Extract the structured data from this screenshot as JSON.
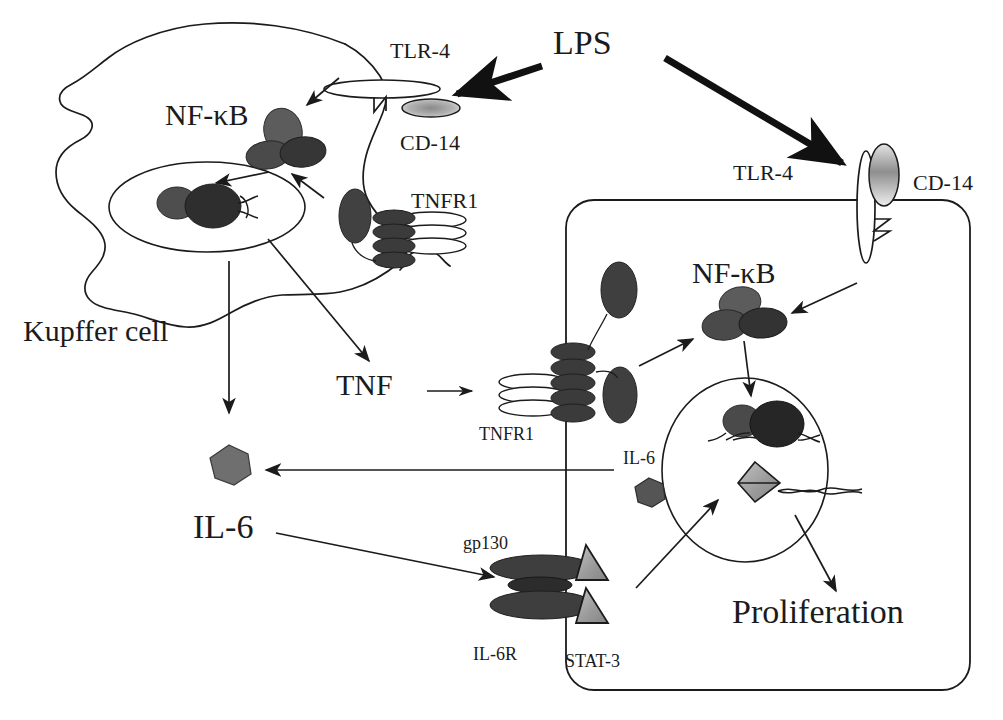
{
  "figure": {
    "kind": "biological-signaling-pathway-diagram",
    "background_color": "#ffffff",
    "ink_color": "#1b1b1b"
  },
  "palette": {
    "outline": "#1b1b1b",
    "protein_dark": "#3a3a3a",
    "protein_mid": "#565656",
    "protein_light_grey": "#8f8f8f",
    "protein_fill_white": "#ffffff",
    "stat3_grey": "#9b9b9b",
    "cd14_grey": "#9a9a9a"
  },
  "labels": {
    "lps": "LPS",
    "kupffer_cell": "Kupffer cell",
    "nfkb_kupffer": "NF-κB",
    "nfkb_hepatocyte": "NF-κB",
    "tlr4_kupffer": "TLR-4",
    "tlr4_hepatocyte": "TLR-4",
    "cd14_kupffer": "CD-14",
    "cd14_hepatocyte": "CD-14",
    "tnfr1_kupffer": "TNFR1",
    "tnfr1_hepatocyte": "TNFR1",
    "tnf": "TNF",
    "il6_free": "IL-6",
    "il6_hepatocyte": "IL-6",
    "gp130": "gp130",
    "il6r": "IL-6R",
    "stat3": "STAT-3",
    "proliferation": "Proliferation"
  },
  "cells": [
    {
      "name": "kupffer-cell",
      "label": "Kupffer cell",
      "shape": "irregular-blob",
      "nucleus": "ellipse"
    },
    {
      "name": "hepatocyte",
      "label": "",
      "shape": "rounded-rectangle",
      "nucleus": "ellipse"
    }
  ],
  "receptors": [
    {
      "name": "tlr4-kupffer",
      "label": "TLR-4",
      "orientation": "horizontal-ellipse"
    },
    {
      "name": "cd14-kupffer",
      "label": "CD-14",
      "orientation": "horizontal-ellipse-shaded"
    },
    {
      "name": "tnfr1-kupffer",
      "label": "TNFR1",
      "orientation": "stacked-ellipses"
    },
    {
      "name": "tlr4-hepatocyte",
      "label": "TLR-4",
      "orientation": "vertical-ellipse"
    },
    {
      "name": "cd14-hepatocyte",
      "label": "CD-14",
      "orientation": "vertical-ellipse-shaded"
    },
    {
      "name": "tnfr1-hepatocyte",
      "label": "TNFR1",
      "orientation": "stacked-ellipses"
    },
    {
      "name": "gp130-il6r",
      "label": "gp130 / IL-6R",
      "orientation": "stacked-horizontal-ellipses"
    }
  ],
  "molecules": [
    {
      "name": "il-6-kupffer-secreted",
      "label": "IL-6",
      "shape": "heptagon",
      "fill": "#707070"
    },
    {
      "name": "il-6-hepatocyte",
      "label": "IL-6",
      "shape": "heptagon",
      "fill": "#565656"
    },
    {
      "name": "stat-3-upper",
      "label": "STAT-3",
      "shape": "triangle",
      "fill": "#9b9b9b"
    },
    {
      "name": "stat-3-lower",
      "label": "STAT-3",
      "shape": "triangle",
      "fill": "#9b9b9b"
    },
    {
      "name": "stat-3-dimer-nucleus",
      "label": "STAT-3",
      "shape": "diamond",
      "fill": "#9b9b9b"
    }
  ],
  "arrows": [
    {
      "name": "arrow-lps-to-kupffer-tlr4",
      "from": "LPS",
      "to": "TLR-4 (Kupffer)",
      "style": "thick-solid"
    },
    {
      "name": "arrow-lps-to-hepatocyte-tlr4",
      "from": "LPS",
      "to": "TLR-4 (hepatocyte)",
      "style": "thick-solid"
    },
    {
      "name": "arrow-tlr4-to-nfkb-kupffer",
      "from": "TLR-4",
      "to": "NF-κB",
      "style": "thin-solid"
    },
    {
      "name": "arrow-tnfr1-to-nfkb-kupffer",
      "from": "TNFR1",
      "to": "NF-κB",
      "style": "thin-solid"
    },
    {
      "name": "arrow-nfkb-to-nucleus-kupffer",
      "from": "NF-κB",
      "to": "nucleus",
      "style": "thin-solid"
    },
    {
      "name": "arrow-kupffer-nucleus-to-il6",
      "from": "nucleus",
      "to": "IL-6",
      "style": "thin-solid"
    },
    {
      "name": "arrow-kupffer-to-tnf",
      "from": "Kupffer cell",
      "to": "TNF",
      "style": "thin-solid"
    },
    {
      "name": "arrow-tnf-to-tnfr1",
      "from": "TNF",
      "to": "TNFR1",
      "style": "thin-solid"
    },
    {
      "name": "arrow-tnfr1-to-nfkb-hepatocyte",
      "from": "TNFR1",
      "to": "NF-κB",
      "style": "thin-solid"
    },
    {
      "name": "arrow-tlr4-to-nfkb-hepatocyte",
      "from": "TLR-4",
      "to": "NF-κB",
      "style": "thin-solid"
    },
    {
      "name": "arrow-nfkb-to-nucleus-hepatocyte",
      "from": "NF-κB",
      "to": "nucleus",
      "style": "thin-solid"
    },
    {
      "name": "arrow-hepatocyte-il6-export",
      "from": "hepatocyte",
      "to": "IL-6",
      "style": "thin-solid"
    },
    {
      "name": "arrow-il6-to-gp130",
      "from": "IL-6",
      "to": "gp130 / IL-6R",
      "style": "thin-solid"
    },
    {
      "name": "arrow-stat3-to-nucleus",
      "from": "STAT-3",
      "to": "nucleus",
      "style": "thin-solid"
    },
    {
      "name": "arrow-nucleus-to-proliferation",
      "from": "nucleus",
      "to": "Proliferation",
      "style": "thin-solid"
    }
  ]
}
